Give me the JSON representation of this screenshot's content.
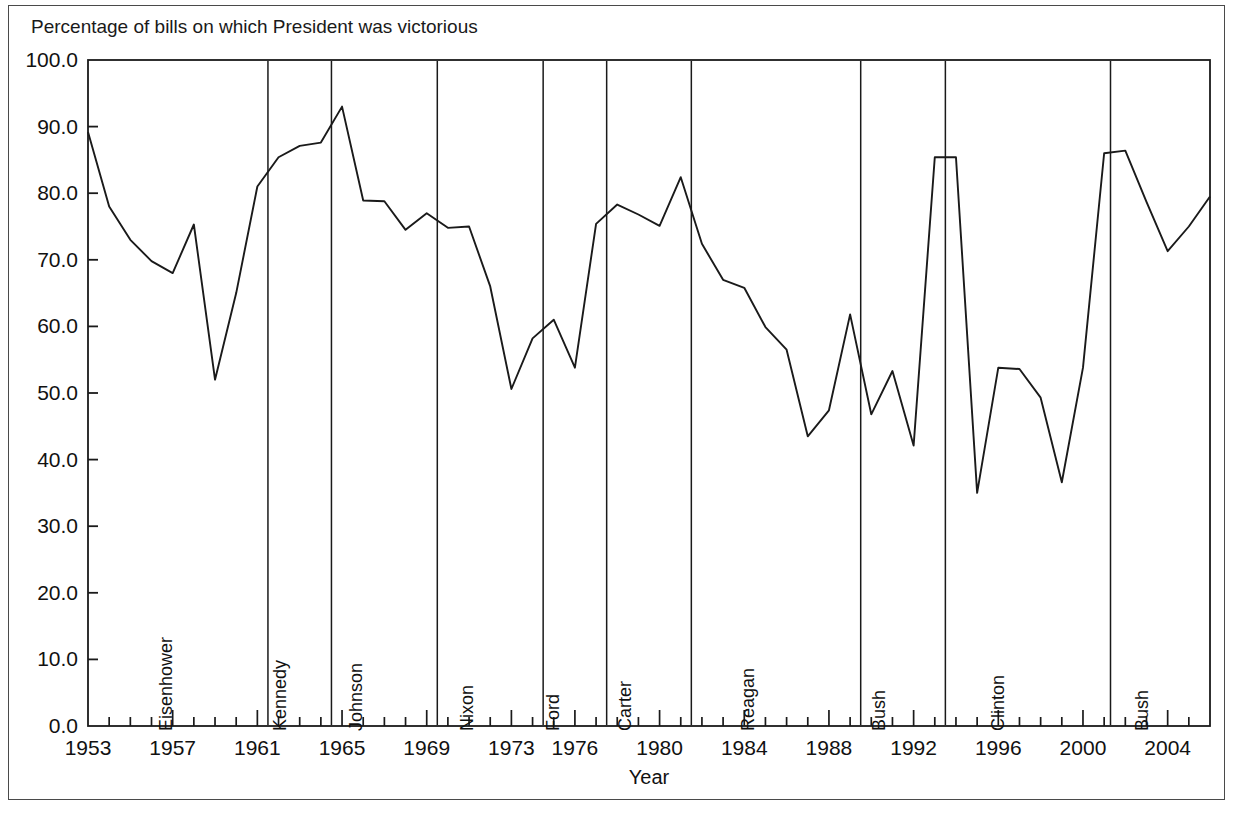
{
  "figure": {
    "title": "Percentage of bills on which President was victorious",
    "background_color": "#ffffff",
    "line_color": "#1a1a1a",
    "frame_color": "#4a4a4a"
  },
  "chart_data": {
    "type": "line",
    "title": "Percentage of bills on which President was victorious",
    "xlabel": "Year",
    "ylabel": "",
    "xlim": [
      1953,
      2006
    ],
    "ylim": [
      0.0,
      100.0
    ],
    "grid": false,
    "legend": null,
    "y_tick_labels": [
      "0.0",
      "10.0",
      "20.0",
      "30.0",
      "40.0",
      "50.0",
      "60.0",
      "70.0",
      "80.0",
      "90.0",
      "100.0"
    ],
    "y_ticks": [
      0,
      10,
      20,
      30,
      40,
      50,
      60,
      70,
      80,
      90,
      100
    ],
    "x_tick_labels": [
      "1953",
      "1957",
      "1961",
      "1965",
      "1969",
      "1973",
      "1976",
      "1980",
      "1984",
      "1988",
      "1992",
      "1996",
      "2000",
      "2004"
    ],
    "x_ticks": [
      1953,
      1957,
      1961,
      1965,
      1969,
      1973,
      1976,
      1980,
      1984,
      1988,
      1992,
      1996,
      2000,
      2004
    ],
    "x_minor_tick_step": 1,
    "x": [
      1953,
      1954,
      1955,
      1956,
      1957,
      1958,
      1959,
      1960,
      1961,
      1962,
      1963,
      1964,
      1965,
      1966,
      1967,
      1968,
      1969,
      1970,
      1971,
      1972,
      1973,
      1974,
      1975,
      1976,
      1977,
      1978,
      1979,
      1980,
      1981,
      1982,
      1983,
      1984,
      1985,
      1986,
      1987,
      1988,
      1989,
      1990,
      1991,
      1992,
      1993,
      1994,
      1995,
      1996,
      1997,
      1998,
      1999,
      2000,
      2001,
      2002,
      2003,
      2004,
      2005,
      2006
    ],
    "values": [
      89.2,
      78.0,
      73.0,
      69.8,
      68.0,
      75.3,
      52.0,
      65.0,
      81.0,
      85.4,
      87.1,
      87.6,
      93.0,
      78.9,
      78.8,
      74.5,
      77.0,
      74.8,
      75.0,
      66.0,
      50.6,
      58.2,
      61.0,
      53.8,
      75.4,
      78.3,
      76.8,
      75.1,
      82.4,
      72.4,
      67.0,
      65.8,
      59.9,
      56.5,
      43.5,
      47.4,
      61.8,
      46.8,
      53.3,
      42.1,
      85.4,
      85.4,
      35.0,
      53.8,
      53.6,
      49.3,
      36.6,
      53.8,
      86.0,
      86.4,
      78.7,
      71.3,
      75.0,
      79.5
    ],
    "president_terms": [
      {
        "name": "Eisenhower",
        "start": 1953,
        "end": 1961.5,
        "label_x": 1957.2
      },
      {
        "name": "Kennedy",
        "start": 1961.5,
        "end": 1964.5,
        "label_x": 1962.6
      },
      {
        "name": "Johnson",
        "start": 1964.5,
        "end": 1969.5,
        "label_x": 1966.2
      },
      {
        "name": "Nixon",
        "start": 1969.5,
        "end": 1974.5,
        "label_x": 1971.4
      },
      {
        "name": "Ford",
        "start": 1974.5,
        "end": 1977.5,
        "label_x": 1975.5
      },
      {
        "name": "Carter",
        "start": 1977.5,
        "end": 1981.5,
        "label_x": 1978.9
      },
      {
        "name": "Reagan",
        "start": 1981.5,
        "end": 1989.5,
        "label_x": 1984.7
      },
      {
        "name": "Bush",
        "start": 1989.5,
        "end": 1993.5,
        "label_x": 1990.9
      },
      {
        "name": "Clinton",
        "start": 1993.5,
        "end": 2001.3,
        "label_x": 1996.5
      },
      {
        "name": "Bush",
        "start": 2001.3,
        "end": 2006,
        "label_x": 2003.3
      }
    ]
  }
}
